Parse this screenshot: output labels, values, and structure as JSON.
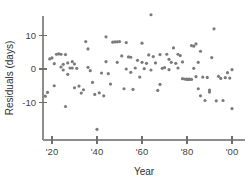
{
  "chart_data": {
    "type": "scatter",
    "title": "",
    "xlabel": "Year",
    "ylabel": "Residuals (days)",
    "xlim": [
      1916,
      2003
    ],
    "ylim": [
      -20,
      18
    ],
    "grid": false,
    "legend": "none",
    "point_color": "#7b7b7b",
    "axis_color": "#8d8d8d",
    "x_tick_values": [
      1920,
      1940,
      1960,
      1980,
      2000
    ],
    "x_tick_labels": [
      "'20",
      "'40",
      "'60",
      "'80",
      "'00"
    ],
    "y_tick_values": [
      10,
      0,
      -10
    ],
    "y_tick_labels": [
      "10",
      "0",
      "-10"
    ],
    "series": [
      {
        "name": "residuals",
        "points": [
          [
            1917,
            -8.1
          ],
          [
            1918,
            -7.0
          ],
          [
            1919,
            3.0
          ],
          [
            1920,
            3.3
          ],
          [
            1921,
            -5.0
          ],
          [
            1921,
            1.6
          ],
          [
            1922,
            4.4
          ],
          [
            1923,
            4.5
          ],
          [
            1924,
            4.4
          ],
          [
            1924,
            0.6
          ],
          [
            1925,
            -0.3
          ],
          [
            1925,
            1.4
          ],
          [
            1926,
            4.3
          ],
          [
            1926,
            -11.2
          ],
          [
            1927,
            -1.6
          ],
          [
            1928,
            0.3
          ],
          [
            1929,
            2.2
          ],
          [
            1929,
            0.3
          ],
          [
            1930,
            1.5
          ],
          [
            1931,
            0.2
          ],
          [
            1932,
            -5.1
          ],
          [
            1933,
            -7.2
          ],
          [
            1934,
            -6.2
          ],
          [
            1935,
            8.2
          ],
          [
            1936,
            6.0
          ],
          [
            1937,
            -0.5
          ],
          [
            1938,
            -4.0
          ],
          [
            1939,
            -7.6
          ],
          [
            1940,
            -18.0
          ],
          [
            1941,
            -7.1
          ],
          [
            1942,
            -1.2
          ],
          [
            1943,
            -8.0
          ],
          [
            1944,
            9.6
          ],
          [
            1945,
            -1.4
          ],
          [
            1946,
            -4.5
          ],
          [
            1947,
            8.0
          ],
          [
            1948,
            8.1
          ],
          [
            1949,
            8.1
          ],
          [
            1949,
            2.0
          ],
          [
            1950,
            8.2
          ],
          [
            1951,
            3.9
          ],
          [
            1952,
            -5.9
          ],
          [
            1953,
            7.9
          ],
          [
            1954,
            3.6
          ],
          [
            1955,
            -1.0
          ],
          [
            1956,
            -6.1
          ],
          [
            1957,
            0.3
          ],
          [
            1958,
            2.6
          ],
          [
            1959,
            -2.4
          ],
          [
            1960,
            2.0
          ],
          [
            1960,
            7.7
          ],
          [
            1961,
            0.1
          ],
          [
            1962,
            1.7
          ],
          [
            1963,
            4.2
          ],
          [
            1964,
            16.2
          ],
          [
            1964,
            -0.3
          ],
          [
            1965,
            3.7
          ],
          [
            1966,
            1.8
          ],
          [
            1967,
            -6.4
          ],
          [
            1968,
            4.3
          ],
          [
            1969,
            0.2
          ],
          [
            1970,
            0.4
          ],
          [
            1971,
            4.4
          ],
          [
            1972,
            -0.2
          ],
          [
            1973,
            2.0
          ],
          [
            1974,
            6.3
          ],
          [
            1975,
            1.7
          ],
          [
            1976,
            0.3
          ],
          [
            1977,
            4.0
          ],
          [
            1978,
            -2.9
          ],
          [
            1978,
            2.1
          ],
          [
            1979,
            -3.0
          ],
          [
            1980,
            -3.1
          ],
          [
            1980,
            -3.0
          ],
          [
            1981,
            -3.1
          ],
          [
            1981,
            -3.0
          ],
          [
            1982,
            7.0
          ],
          [
            1982,
            -3.1
          ],
          [
            1983,
            6.8
          ],
          [
            1983,
            0.2
          ],
          [
            1984,
            7.5
          ],
          [
            1984,
            -2.3
          ],
          [
            1985,
            2.0
          ],
          [
            1985,
            -5.9
          ],
          [
            1986,
            5.3
          ],
          [
            1986,
            -8.0
          ],
          [
            1987,
            -2.4
          ],
          [
            1988,
            -9.4
          ],
          [
            1989,
            -2.5
          ],
          [
            1990,
            -6.3
          ],
          [
            1991,
            3.4
          ],
          [
            1992,
            12.0
          ],
          [
            1993,
            -9.5
          ],
          [
            1994,
            -2.2
          ],
          [
            1995,
            -2.8
          ],
          [
            1996,
            -9.4
          ],
          [
            1997,
            -2.6
          ],
          [
            1998,
            -1.1
          ],
          [
            1999,
            -2.7
          ],
          [
            2000,
            -0.2
          ],
          [
            2000,
            -11.8
          ],
          [
            1927,
            1.8
          ],
          [
            1930,
            -5.6
          ],
          [
            1944,
            2.2
          ],
          [
            1955,
            3.5
          ],
          [
            1968,
            -4.6
          ],
          [
            1972,
            2.9
          ],
          [
            1976,
            4.4
          ],
          [
            1990,
            -6.9
          ],
          [
            1936,
            0.5
          ],
          [
            1953,
            0.0
          ]
        ]
      }
    ]
  },
  "geometry": {
    "x_axis_y": 140,
    "y_axis_x": 43,
    "y_axis_top": 16,
    "y_axis_bottom": 140,
    "x_axis_right": 245,
    "px_per_year": 2.25,
    "px_per_unit": 3.35,
    "zero_y": 69,
    "year_origin_x": 52,
    "year_origin": 1920,
    "point_radius": 1.6
  }
}
